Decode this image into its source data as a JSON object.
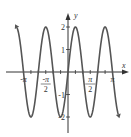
{
  "chart_data": {
    "type": "line",
    "title": "",
    "function": "y = 2 sin(3x)",
    "xlabel": "x",
    "ylabel": "y",
    "xlim": [
      -3.5,
      3.5
    ],
    "ylim": [
      -2.3,
      2.3
    ],
    "x_ticks": [
      {
        "value": -3.14159,
        "label": "-π"
      },
      {
        "value": -1.5708,
        "label": "-π/2"
      },
      {
        "value": 1.5708,
        "label": "π/2"
      },
      {
        "value": 3.14159,
        "label": "π"
      }
    ],
    "y_ticks": [
      {
        "value": 2,
        "label": "2"
      },
      {
        "value": 1,
        "label": "1"
      },
      {
        "value": -1,
        "label": "-1"
      },
      {
        "value": -2,
        "label": "-2"
      }
    ],
    "series": [
      {
        "name": "2sin(3x)",
        "amplitude": 2,
        "frequency": 3,
        "x_range": [
          -3.5,
          3.5
        ],
        "color": "#555555"
      }
    ],
    "grid": false,
    "legend": null
  },
  "colors": {
    "curve": "#555555",
    "axis": "#333333",
    "text": "#333333"
  }
}
